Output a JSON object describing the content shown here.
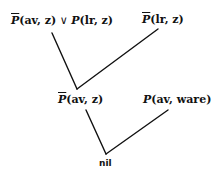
{
  "diagram": {
    "type": "resolution-tree",
    "nodes": {
      "top_left": {
        "neg": "P",
        "args": "(av, z)",
        "or": " ∨ ",
        "pos": "P",
        "args2": "(lr, z)",
        "full": "P̄(av, z) ∨ P(lr, z)"
      },
      "top_right": {
        "neg": "P",
        "args": "(lr, z)",
        "full": "P̄(lr, z)"
      },
      "middle_left": {
        "neg": "P",
        "args": "(av, z)",
        "full": "P̄(av, z)"
      },
      "middle_right": {
        "pos": "P",
        "args": "(av,  ware)",
        "full": "P(av, ware)"
      },
      "bottom": {
        "label": "nil"
      }
    },
    "edges": [
      {
        "from": "top_left",
        "to": "middle_left"
      },
      {
        "from": "top_right",
        "to": "middle_left"
      },
      {
        "from": "middle_left",
        "to": "bottom"
      },
      {
        "from": "middle_right",
        "to": "bottom"
      }
    ],
    "colors": {
      "ink": "#111111",
      "background": "#ffffff"
    }
  }
}
